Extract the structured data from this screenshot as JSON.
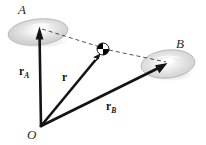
{
  "figure": {
    "background_color": "#ffffff",
    "width": 206,
    "height": 145
  },
  "labels": {
    "body_a": "A",
    "body_b": "B",
    "origin": "O",
    "vector_a_symbol": "r",
    "vector_a_subscript": "A",
    "vector_b_symbol": "r",
    "vector_b_subscript": "B",
    "vector_rel_symbol": "r"
  },
  "colors": {
    "stroke": "#141414",
    "disk_fill": "#d8d8d8",
    "disk_highlight": "#ffffff",
    "disk_edge": "#9a9a9a",
    "dashed": "#4a4a4a",
    "marker_dark": "#000000",
    "marker_light": "#ffffff"
  },
  "geometry": {
    "origin_point": {
      "x": 41,
      "y": 126
    },
    "disk_a": {
      "cx": 38,
      "cy": 32,
      "rx": 30,
      "ry": 13,
      "rotation": -6
    },
    "disk_b": {
      "cx": 168,
      "cy": 64,
      "rx": 27,
      "ry": 14,
      "rotation": -6
    },
    "marker_point": {
      "x": 103,
      "y": 49,
      "r": 6
    },
    "arrow_a_tip": {
      "x": 40,
      "y": 29
    },
    "arrow_rel_tip": {
      "x": 100,
      "y": 53
    },
    "arrow_b_tip": {
      "x": 167,
      "y": 63
    },
    "dashed_line": [
      {
        "x": 40,
        "y": 29
      },
      {
        "x": 97,
        "y": 46
      },
      {
        "x": 166,
        "y": 62
      }
    ]
  },
  "elements": {
    "vector_a_name": "vector r subscript A from origin to body A",
    "vector_b_name": "vector r subscript B from origin to body B",
    "vector_rel_name": "relative vector r from origin to particle",
    "dashed_name": "dashed construction line from A through particle to B"
  }
}
